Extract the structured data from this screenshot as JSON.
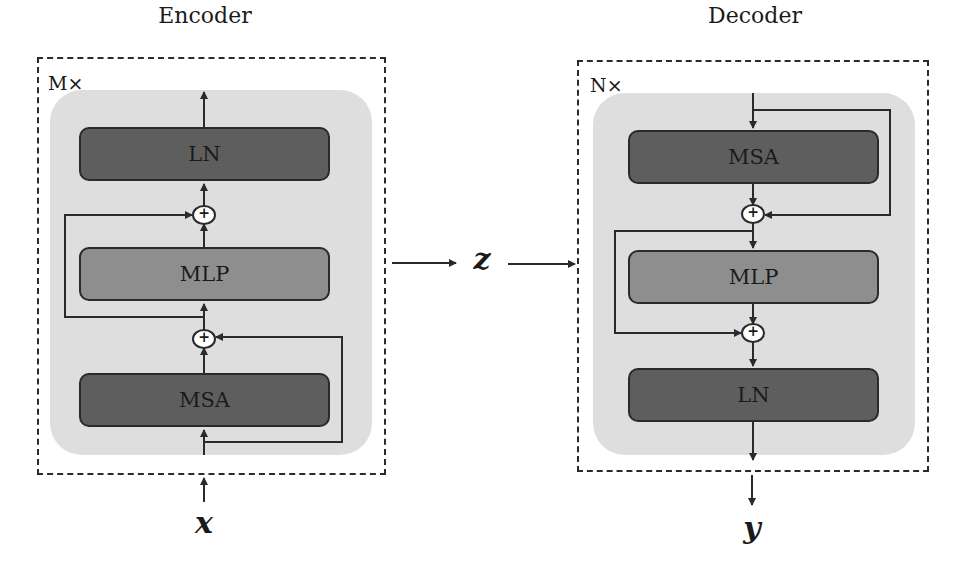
{
  "encoder": {
    "title": "Encoder",
    "repeat_label": "M×",
    "blocks": [
      {
        "id": "ln",
        "label": "LN",
        "shade": "dark"
      },
      {
        "id": "mlp",
        "label": "MLP",
        "shade": "mid"
      },
      {
        "id": "msa",
        "label": "MSA",
        "shade": "dark"
      }
    ],
    "adders": [
      "+",
      "+"
    ],
    "input_label": "x"
  },
  "decoder": {
    "title": "Decoder",
    "repeat_label": "N×",
    "blocks": [
      {
        "id": "msa",
        "label": "MSA",
        "shade": "dark"
      },
      {
        "id": "mlp",
        "label": "MLP",
        "shade": "mid"
      },
      {
        "id": "ln",
        "label": "LN",
        "shade": "dark"
      }
    ],
    "adders": [
      "+",
      "+"
    ],
    "output_label": "y"
  },
  "latent": {
    "label": "z"
  },
  "colors": {
    "dark_block": "#5e5e5e",
    "mid_block": "#8e8e8e",
    "panel": "#dedede",
    "line": "#2a2a2a"
  }
}
